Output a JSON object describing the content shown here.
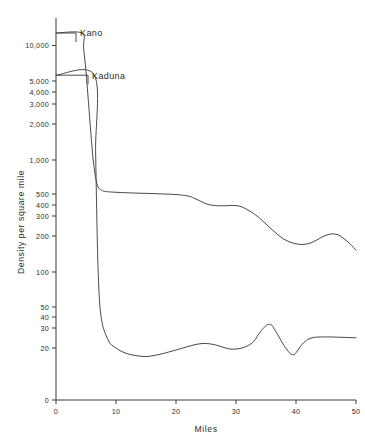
{
  "chart_data": {
    "type": "line",
    "title": "",
    "xlabel": "Miles",
    "ylabel": "Density per square mile",
    "xlim": [
      0,
      50
    ],
    "xticks": [
      0,
      10,
      20,
      30,
      40,
      50
    ],
    "xtick_labels": [
      "0",
      "10",
      "20",
      "30",
      "40",
      "50"
    ],
    "yscale": "log-like broken scale",
    "yticks": [
      10000,
      5000,
      4000,
      3000,
      2000,
      1000,
      500,
      400,
      300,
      200,
      100,
      50,
      40,
      30,
      20,
      0
    ],
    "ytick_labels": [
      "10,000",
      "5,000",
      "4,000",
      "3,000",
      "2,000",
      "1,000",
      "500",
      "400",
      "300",
      "200",
      "100",
      "50",
      "40",
      "30",
      "20",
      "0"
    ],
    "grid": false,
    "legend": "inline annotations",
    "annotations": [
      {
        "text": "Kano",
        "value": 12000,
        "at_x": 0
      },
      {
        "text": "Kaduna",
        "value": 5600,
        "at_x": 0
      }
    ],
    "series": [
      {
        "name": "Kano",
        "x": [
          0,
          4.3,
          4.6,
          5.0,
          5.4,
          5.8,
          6.2,
          6.6,
          7.0,
          7.6,
          8.4,
          10,
          12,
          14,
          16,
          18,
          20,
          22,
          23,
          24,
          25,
          26,
          27,
          28,
          29,
          30,
          31,
          32,
          33,
          34,
          35,
          36,
          37,
          38,
          39,
          40,
          41,
          42,
          43,
          44,
          45,
          46,
          47,
          48,
          49,
          50
        ],
        "y": [
          12000,
          12000,
          9500,
          6000,
          3200,
          1700,
          1000,
          700,
          580,
          540,
          525,
          518,
          512,
          508,
          505,
          500,
          495,
          480,
          460,
          435,
          410,
          398,
          392,
          392,
          394,
          394,
          380,
          350,
          318,
          285,
          255,
          228,
          205,
          188,
          178,
          172,
          170,
          172,
          180,
          192,
          203,
          209,
          205,
          190,
          172,
          152
        ]
      },
      {
        "name": "Kaduna",
        "x": [
          0,
          6.4,
          6.6,
          6.8,
          7.0,
          7.3,
          7.7,
          8.2,
          9,
          10,
          11,
          12,
          13,
          14,
          15,
          16,
          17,
          18,
          19,
          20,
          21,
          22,
          23,
          24,
          25,
          26,
          27,
          28,
          29,
          30,
          31,
          32,
          33,
          34,
          35,
          35.5,
          36,
          37,
          38,
          39,
          39.5,
          40,
          41,
          42,
          43,
          44,
          46,
          48,
          50
        ],
        "y": [
          5600,
          5600,
          1200,
          300,
          110,
          52,
          34,
          27,
          22,
          20,
          18.6,
          17.8,
          17.3,
          17.0,
          16.9,
          17.1,
          17.5,
          18.0,
          18.6,
          19.2,
          19.9,
          20.6,
          21.3,
          21.8,
          21.9,
          21.6,
          21.0,
          20.2,
          19.6,
          19.6,
          20.0,
          21.0,
          23.0,
          27.5,
          32.0,
          33.0,
          32.0,
          26.0,
          21.0,
          18.0,
          17.5,
          18.2,
          21.5,
          23.8,
          24.8,
          25.0,
          25.0,
          24.8,
          24.6
        ]
      }
    ]
  },
  "axis": {
    "y_title": "Density per square mile",
    "x_title": "Miles"
  },
  "labels": {
    "kano": "Kano",
    "kaduna": "Kaduna"
  },
  "style": {
    "curve_color": "#4a4a4a",
    "axis_color": "#3a3a3a",
    "text_color": "#2b2b2b",
    "background": "#ffffff"
  }
}
